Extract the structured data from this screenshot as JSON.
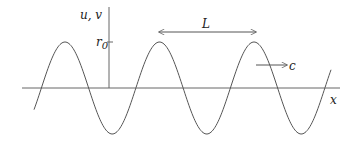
{
  "diagram": {
    "labels": {
      "vertical_axis": "u, v",
      "horizontal_axis": "x",
      "amplitude_r": "r",
      "amplitude_sub": "0",
      "wavelength": "L",
      "speed": "c"
    },
    "wave": {
      "type": "sine",
      "amplitude_label": "r0",
      "wavelength_label": "L",
      "propagation": "right",
      "peaks_visible": 3,
      "troughs_visible": 2
    },
    "colors": {
      "line": "#555555",
      "text": "#222222",
      "background": "#ffffff"
    }
  }
}
